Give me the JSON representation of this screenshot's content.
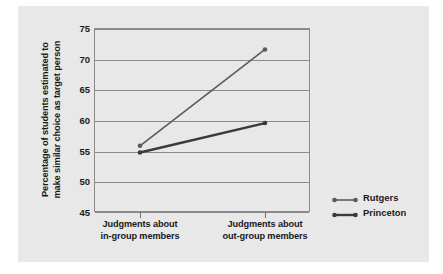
{
  "chart_data": {
    "type": "line",
    "title": "",
    "xlabel": "",
    "ylabel": "Percentage of students estimated to make similar choice as target person",
    "ylabel_lines": [
      "Percentage of students estimated to",
      "make similar choice as target person"
    ],
    "categories": [
      "Judgments about in-group members",
      "Judgments about out-group members"
    ],
    "category_lines": [
      [
        "Judgments about",
        "in-group members"
      ],
      [
        "Judgments about",
        "out-group members"
      ]
    ],
    "series": [
      {
        "name": "Rutgers",
        "values": [
          55.8,
          71.5
        ],
        "color": "#5a5a5a",
        "width": 1.6
      },
      {
        "name": "Princeton",
        "values": [
          54.7,
          59.5
        ],
        "color": "#3a3a3a",
        "width": 2.4
      }
    ],
    "ylim": [
      45,
      75
    ],
    "yticks": [
      75,
      70,
      65,
      60,
      55,
      50,
      45
    ],
    "ytick_labels": [
      "75",
      "70",
      "65",
      "60",
      "55",
      "50",
      "45"
    ],
    "grid": true,
    "legend_position": "right",
    "legend": [
      {
        "label": "Rutgers"
      },
      {
        "label": "Princeton"
      }
    ],
    "colors": {
      "background": "#e8e8e8",
      "axis": "#8a8a8a",
      "text": "#1a1a1a",
      "rutgers": "#5a5a5a",
      "princeton": "#3a3a3a"
    }
  }
}
